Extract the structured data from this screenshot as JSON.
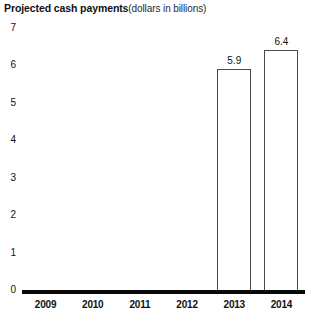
{
  "chart_data": {
    "type": "bar",
    "title": "Projected cash payments",
    "subtitle": "(dollars in billions)",
    "xlabel": "",
    "ylabel": "",
    "categories": [
      "2009",
      "2010",
      "2011",
      "2012",
      "2013",
      "2014"
    ],
    "values": [
      null,
      null,
      null,
      null,
      5.9,
      6.4
    ],
    "value_labels": [
      "",
      "",
      "",
      "",
      "5.9",
      "6.4"
    ],
    "ylim": [
      0,
      7
    ],
    "y_ticks": [
      "7",
      "6",
      "5",
      "4",
      "3",
      "2",
      "1",
      "0"
    ],
    "grid": false,
    "legend": false,
    "bar_fill_color": "#ffffff",
    "bar_edge_color": "#4a4a4a",
    "axis_color": "#0a0a0a",
    "background_color": "#ffffff"
  }
}
